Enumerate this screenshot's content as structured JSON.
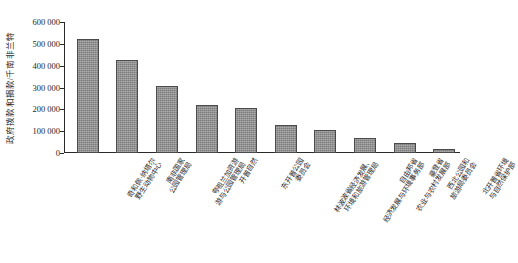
{
  "chart_data": {
    "type": "bar",
    "title": "",
    "subtitle": "",
    "xlabel": "",
    "ylabel": "政府拨款和捐款/千南非兰特",
    "ylim": [
      0,
      600000
    ],
    "ytick_values": [
      600000,
      500000,
      400000,
      300000,
      200000,
      100000,
      0
    ],
    "ytick_labels": [
      "600 000",
      "500 000",
      "400 000",
      "300 000",
      "200 000",
      "100 000",
      "0"
    ],
    "grid": false,
    "legend": null,
    "bar_color": "#8d8d8d",
    "bar_edge_color": "#4b4b4b",
    "axis_color": "#2a2a2a",
    "categories": [
      "奇和佩·纳塔尔野生动物中心",
      "南非国家公园管理局",
      "夸祖兰加资游与公园管理局",
      "开普自然",
      "东开普公园委员会",
      "林波波省经济发展、环境和旅游管理局",
      "自由邦省经济发展与环境事务部",
      "豪登省农业与农村发展部",
      "西北公园和旅游局委员会",
      "北开普省环境与自然保护部"
    ],
    "category_lines": [
      [
        "奇和佩·纳塔尔",
        "野生动物中心"
      ],
      [
        "南非国家",
        "公园管理局"
      ],
      [
        "夸祖兰加资游",
        "游与公园管理局"
      ],
      [
        "开普自然",
        ""
      ],
      [
        "东开普公园",
        "委员会"
      ],
      [
        "林波波省经济发展、",
        "环境和旅游管理局"
      ],
      [
        "自由邦省",
        "经济发展与环境事务部"
      ],
      [
        "豪登省",
        "农业与农村发展部"
      ],
      [
        "西北公园和",
        "旅游局委员会"
      ],
      [
        "北开普省环境",
        "与自然保护部"
      ]
    ],
    "values": [
      520000,
      425000,
      305000,
      222000,
      207000,
      127000,
      105000,
      68000,
      48000,
      18000
    ]
  }
}
